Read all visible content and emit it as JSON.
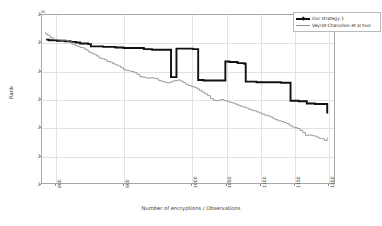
{
  "chart_data": {
    "type": "line",
    "title": "",
    "xlabel": "Number of encryptions / Observations",
    "ylabel": "Rank",
    "xlim": [
      780,
      1210
    ],
    "ylim": [
      10,
      40
    ],
    "y_scale": "log2",
    "grid": true,
    "legend_position": "upper-right",
    "xticks": [
      800,
      900,
      1000,
      1050,
      1100,
      1150,
      1200
    ],
    "xtick_labels": [
      "800",
      "900",
      "1000",
      "1050",
      "1100",
      "1150",
      "1200"
    ],
    "yticks": [
      10,
      15,
      20,
      25,
      30,
      35,
      40
    ],
    "ytick_labels": [
      "2^10",
      "2^15",
      "2^20",
      "2^25",
      "2^30",
      "2^35",
      "2^40"
    ],
    "ytick_bases": [
      "2",
      "2",
      "2",
      "2",
      "2",
      "2",
      "2"
    ],
    "ytick_exponents": [
      "10",
      "15",
      "20",
      "25",
      "30",
      "35",
      "40"
    ],
    "series": [
      {
        "name": "Our strategy 1",
        "color": "#111111",
        "width": 1.9,
        "marker": "diamond",
        "step": true,
        "x": [
          786,
          790,
          796,
          802,
          808,
          814,
          818,
          822,
          826,
          830,
          836,
          842,
          848,
          852,
          858,
          864,
          870,
          876,
          882,
          888,
          892,
          896,
          900,
          906,
          912,
          918,
          924,
          930,
          936,
          942,
          948,
          954,
          960,
          966,
          970,
          974,
          976,
          978,
          980,
          982,
          986,
          990,
          996,
          1002,
          1006,
          1010,
          1012,
          1014,
          1018,
          1024,
          1030,
          1036,
          1042,
          1046,
          1050,
          1052,
          1056,
          1062,
          1068,
          1074,
          1078,
          1080,
          1084,
          1090,
          1096,
          1102,
          1108,
          1114,
          1120,
          1126,
          1132,
          1138,
          1142,
          1146,
          1152,
          1158,
          1164,
          1170,
          1176,
          1182,
          1188,
          1194,
          1198,
          1200
        ],
        "y": [
          35.6,
          35.5,
          35.5,
          35.4,
          35.4,
          35.3,
          35.3,
          35.2,
          35.2,
          35.1,
          34.9,
          34.9,
          34.8,
          34.4,
          34.4,
          34.4,
          34.3,
          34.3,
          34.3,
          34.2,
          34.2,
          34.2,
          34.1,
          34.1,
          34.1,
          34.1,
          34.1,
          33.9,
          33.9,
          33.8,
          33.8,
          33.8,
          33.8,
          33.8,
          28.9,
          28.9,
          28.9,
          34.0,
          34.0,
          34.0,
          34.0,
          34.0,
          34.0,
          33.9,
          33.9,
          28.4,
          28.4,
          28.4,
          28.3,
          28.3,
          28.3,
          28.3,
          28.3,
          28.3,
          31.7,
          31.7,
          31.6,
          31.6,
          31.4,
          31.4,
          31.3,
          28.1,
          28.1,
          28.1,
          28.0,
          28.0,
          28.0,
          28.0,
          28.0,
          28.0,
          27.9,
          27.9,
          27.9,
          24.7,
          24.7,
          24.6,
          24.6,
          24.2,
          24.2,
          24.1,
          24.1,
          24.1,
          24.1,
          22.4
        ]
      },
      {
        "name": "Veyrat-Charvillon et al tool",
        "color": "#8d8d8d",
        "width": 0.85,
        "marker": "line",
        "step": true,
        "x": [
          784,
          786,
          788,
          792,
          796,
          800,
          806,
          812,
          816,
          820,
          824,
          828,
          832,
          836,
          840,
          844,
          848,
          852,
          856,
          860,
          864,
          868,
          872,
          876,
          880,
          884,
          888,
          892,
          896,
          900,
          904,
          908,
          912,
          916,
          920,
          924,
          928,
          932,
          936,
          940,
          944,
          948,
          952,
          956,
          960,
          964,
          968,
          972,
          976,
          980,
          984,
          988,
          992,
          996,
          1000,
          1004,
          1008,
          1012,
          1016,
          1020,
          1024,
          1028,
          1032,
          1036,
          1040,
          1044,
          1048,
          1052,
          1056,
          1060,
          1064,
          1068,
          1072,
          1076,
          1080,
          1084,
          1088,
          1092,
          1096,
          1100,
          1104,
          1108,
          1112,
          1116,
          1120,
          1124,
          1128,
          1132,
          1136,
          1140,
          1144,
          1148,
          1152,
          1156,
          1160,
          1164,
          1168,
          1172,
          1176,
          1180,
          1184,
          1188,
          1192,
          1196,
          1200
        ],
        "y": [
          36.8,
          36.6,
          36.4,
          36.0,
          35.7,
          35.6,
          35.5,
          35.5,
          35.4,
          35.2,
          34.8,
          34.6,
          34.4,
          34.2,
          34.1,
          33.8,
          33.4,
          33.2,
          33.0,
          32.7,
          32.3,
          32.2,
          32.0,
          31.7,
          31.6,
          31.3,
          31.1,
          30.9,
          30.6,
          30.2,
          30.1,
          30.0,
          29.9,
          29.7,
          29.4,
          29.0,
          28.9,
          28.8,
          28.7,
          28.8,
          28.7,
          28.6,
          28.3,
          28.1,
          28.0,
          27.9,
          28.0,
          28.2,
          28.3,
          28.4,
          28.2,
          27.9,
          27.6,
          27.4,
          27.2,
          27.1,
          26.8,
          26.5,
          26.2,
          25.9,
          25.6,
          25.1,
          24.8,
          24.7,
          24.8,
          24.9,
          24.7,
          24.6,
          24.4,
          24.3,
          24.1,
          23.9,
          23.7,
          23.6,
          23.4,
          23.2,
          23.0,
          22.9,
          22.7,
          22.5,
          22.3,
          22.1,
          22.0,
          21.8,
          21.5,
          21.3,
          21.1,
          21.0,
          20.8,
          20.6,
          20.3,
          20.0,
          19.9,
          19.7,
          19.4,
          19.0,
          18.5,
          18.6,
          18.5,
          18.4,
          18.2,
          18.0,
          17.9,
          17.6,
          18.1
        ]
      }
    ]
  },
  "legend": {
    "entries": [
      {
        "label": "Our strategy 1",
        "color": "#111111",
        "width": 1.9,
        "marker": "diamond"
      },
      {
        "label": "Veyrat-Charvillon et al tool",
        "color": "#8d8d8d",
        "width": 0.85,
        "marker": "line"
      }
    ]
  },
  "axes": {
    "x_title": "Number of encryptions / Observations",
    "y_title": "Rank"
  }
}
